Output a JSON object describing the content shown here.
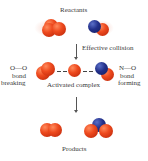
{
  "title": "Reactants",
  "step1": {
    "label": "Effective collision"
  },
  "activated": {
    "label": "Activated complex",
    "left_bond": "O—O",
    "left_text_1": "bond",
    "left_text_2": "breaking",
    "right_bond": "N—O",
    "right_text_1": "bond",
    "right_text_2": "forming"
  },
  "products": {
    "label": "Products"
  },
  "colors": {
    "oxygen": "#e8431b",
    "nitrogen": "#1f2d86",
    "text": "#3a3a3a"
  }
}
